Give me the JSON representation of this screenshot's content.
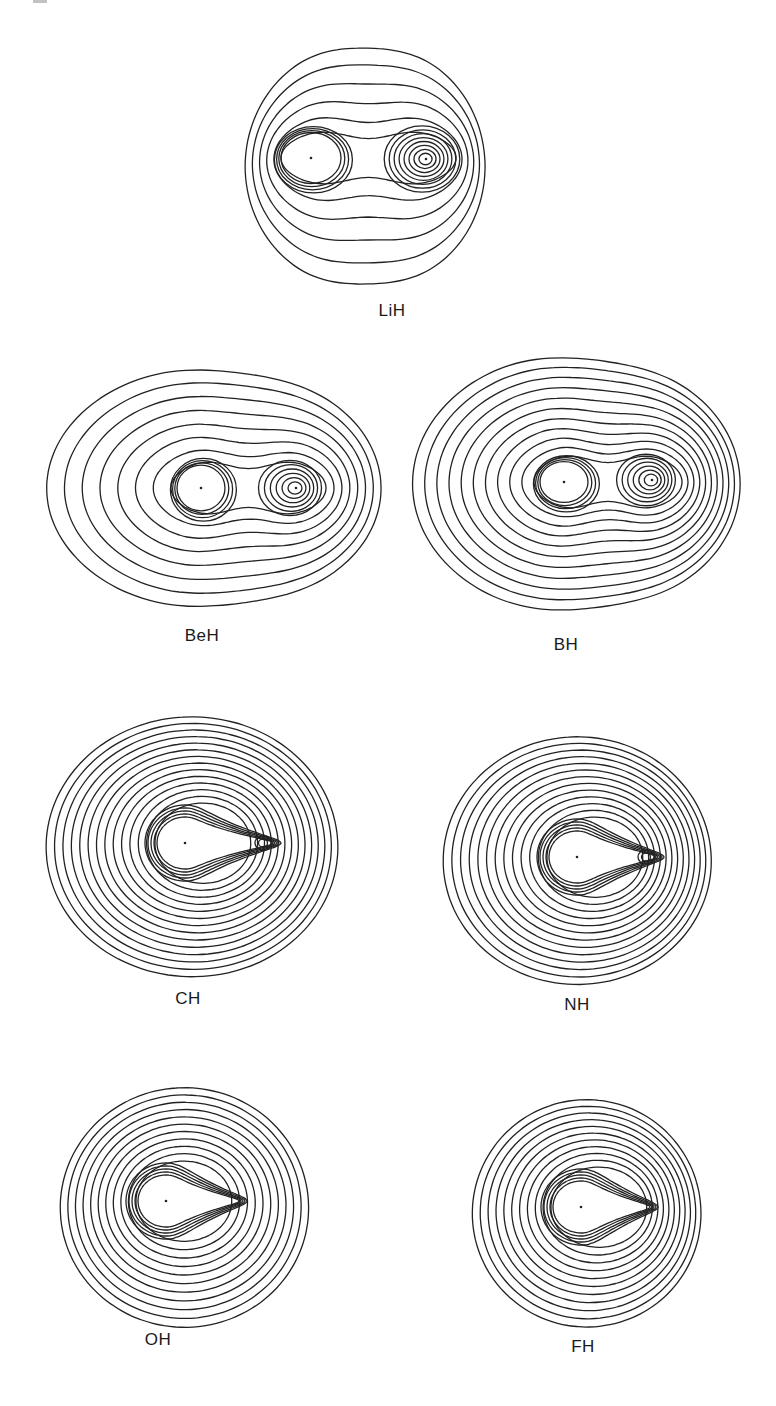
{
  "figure": {
    "type": "electron density contour maps",
    "panels": [
      {
        "label": "LiH",
        "heavy": [
          311,
          158
        ],
        "h": [
          426,
          159
        ],
        "label_pos": [
          392,
          312
        ],
        "outer": {
          "cx": 368,
          "cy": 162,
          "rx": 122,
          "ry": 122,
          "skew": 0.35
        },
        "n_outer": 6,
        "heavy_core": 16,
        "h_core": 7,
        "neck": true,
        "style": "two-center-wide"
      },
      {
        "label": "BeH",
        "heavy": [
          201,
          488
        ],
        "h": [
          296,
          488
        ],
        "label_pos": [
          202,
          637
        ],
        "outer": {
          "cx": 215,
          "cy": 487,
          "rx": 168,
          "ry": 122,
          "skew": 0.1
        },
        "n_outer": 8,
        "heavy_core": 6,
        "h_core": 5,
        "neck": true,
        "style": "two-center-wide"
      },
      {
        "label": "BH",
        "heavy": [
          564,
          482
        ],
        "h": [
          652,
          480
        ],
        "label_pos": [
          566,
          646
        ],
        "outer": {
          "cx": 578,
          "cy": 482,
          "rx": 165,
          "ry": 130,
          "skew": 0.15
        },
        "n_outer": 11,
        "heavy_core": 6,
        "h_core": 5,
        "neck": true,
        "style": "two-center"
      },
      {
        "label": "CH",
        "heavy": [
          185,
          843
        ],
        "h": [
          263,
          843
        ],
        "label_pos": [
          188,
          1000
        ],
        "outer": {
          "cx": 195,
          "cy": 843,
          "rx": 148,
          "ry": 128,
          "skew": 0.25
        },
        "n_outer": 14,
        "heavy_core": 5,
        "h_core": 2,
        "neck": false,
        "style": "teardrop-h"
      },
      {
        "label": "NH",
        "heavy": [
          577,
          857
        ],
        "h": [
          646,
          857
        ],
        "label_pos": [
          577,
          1006
        ],
        "outer": {
          "cx": 580,
          "cy": 857,
          "rx": 136,
          "ry": 122,
          "skew": 0.25
        },
        "n_outer": 13,
        "heavy_core": 5,
        "h_core": 2,
        "neck": false,
        "style": "teardrop-h"
      },
      {
        "label": "OH",
        "heavy": [
          166,
          1201
        ],
        "h": [
          239,
          1201
        ],
        "label_pos": [
          158,
          1341
        ],
        "outer": {
          "cx": 187,
          "cy": 1204,
          "rx": 126,
          "ry": 118,
          "skew": 0.25
        },
        "n_outer": 11,
        "heavy_core": 5,
        "h_core": 0,
        "neck": false,
        "style": "teardrop"
      },
      {
        "label": "FH",
        "heavy": [
          581,
          1207
        ],
        "h": [
          650,
          1207
        ],
        "label_pos": [
          583,
          1348
        ],
        "outer": {
          "cx": 589,
          "cy": 1210,
          "rx": 116,
          "ry": 112,
          "skew": 0.25
        },
        "n_outer": 11,
        "heavy_core": 5,
        "h_core": 0,
        "neck": false,
        "style": "teardrop"
      }
    ]
  },
  "colors": {
    "line": "#222222",
    "background": "#ffffff",
    "label": "#1a1a1a"
  }
}
